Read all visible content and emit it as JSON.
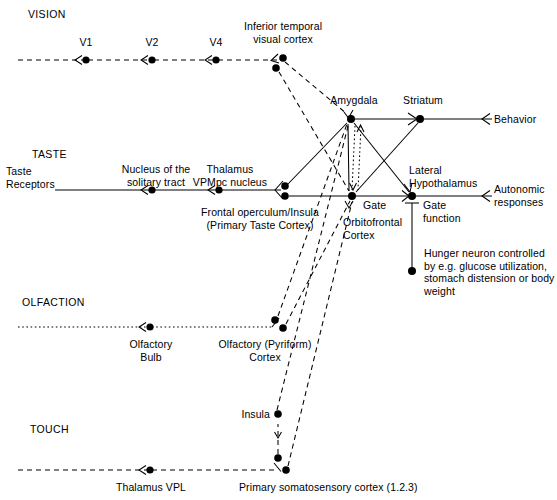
{
  "diagram": {
    "background_color": "#ffffff",
    "line_color": "#000000",
    "node_color": "#000000",
    "width": 557,
    "height": 500
  },
  "modalities": [
    {
      "name": "vision-heading",
      "label": "VISION"
    },
    {
      "name": "taste-heading",
      "label": "TASTE"
    },
    {
      "name": "olfaction-heading",
      "label": "OLFACTION"
    },
    {
      "name": "touch-heading",
      "label": "TOUCH"
    }
  ],
  "labels": {
    "vision": "VISION",
    "taste": "TASTE",
    "olfaction": "OLFACTION",
    "touch": "TOUCH",
    "v1": "V1",
    "v2": "V2",
    "v4": "V4",
    "inferior_temporal": "Inferior temporal\nvisual cortex",
    "taste_receptors": "Taste\nReceptors",
    "nucleus_solitary_tract": "Nucleus of the\nsolitary tract",
    "thalamus_vpmpc": "Thalamus\nVPMpc nucleus",
    "frontal_operculum": "Frontal operculum/Insula\n(Primary Taste Cortex)",
    "olfactory_bulb": "Olfactory\nBulb",
    "olfactory_pyriform": "Olfactory (Pyriform)\nCortex",
    "insula": "Insula",
    "thalamus_vpl": "Thalamus VPL",
    "primary_somatosensory": "Primary somatosensory cortex (1.2.3)",
    "amygdala": "Amygdala",
    "striatum": "Striatum",
    "behavior": "Behavior",
    "lateral_hypothalamus": "Lateral\nHypothalamus",
    "gate": "Gate",
    "gate_function": "Gate\nfunction",
    "orbitofrontal_cortex": "Orbitofrontal\nCortex",
    "autonomic_responses": "Autonomic\nresponses",
    "hunger_neuron": "Hunger neuron controlled\nby e.g. glucose utilization,\nstomach distension or body\nweight"
  },
  "nodes": [
    {
      "name": "node-v1",
      "label": "V1",
      "x": 86,
      "y": 60
    },
    {
      "name": "node-v2",
      "label": "V2",
      "x": 152,
      "y": 60
    },
    {
      "name": "node-v4",
      "label": "V4",
      "x": 216,
      "y": 60
    },
    {
      "name": "node-inferior-temporal-a",
      "label": "Inferior temporal visual cortex",
      "x": 283,
      "y": 58
    },
    {
      "name": "node-inferior-temporal-b",
      "label": "Inferior temporal visual cortex",
      "x": 276,
      "y": 68
    },
    {
      "name": "node-nucleus-solitary-tract",
      "label": "Nucleus of the solitary tract",
      "x": 152,
      "y": 190
    },
    {
      "name": "node-thalamus-vpmpc",
      "label": "Thalamus VPMpc nucleus",
      "x": 219,
      "y": 190
    },
    {
      "name": "node-frontal-operculum-a",
      "label": "Frontal operculum/Insula",
      "x": 285,
      "y": 186
    },
    {
      "name": "node-frontal-operculum-b",
      "label": "Frontal operculum/Insula",
      "x": 285,
      "y": 196
    },
    {
      "name": "node-olfactory-bulb",
      "label": "Olfactory Bulb",
      "x": 150,
      "y": 327
    },
    {
      "name": "node-olfactory-cortex-a",
      "label": "Olfactory (Pyriform) Cortex",
      "x": 275,
      "y": 320
    },
    {
      "name": "node-olfactory-cortex-b",
      "label": "Olfactory (Pyriform) Cortex",
      "x": 283,
      "y": 328
    },
    {
      "name": "node-insula",
      "label": "Insula",
      "x": 278,
      "y": 414
    },
    {
      "name": "node-thalamus-vpl",
      "label": "Thalamus VPL",
      "x": 150,
      "y": 470
    },
    {
      "name": "node-somatosensory-a",
      "label": "Primary somatosensory cortex (1.2.3)",
      "x": 278,
      "y": 458
    },
    {
      "name": "node-somatosensory-b",
      "label": "Primary somatosensory cortex (1.2.3)",
      "x": 286,
      "y": 470
    },
    {
      "name": "node-amygdala",
      "label": "Amygdala",
      "x": 351,
      "y": 119
    },
    {
      "name": "node-striatum",
      "label": "Striatum",
      "x": 420,
      "y": 119
    },
    {
      "name": "node-orbitofrontal-cortex",
      "label": "Orbitofrontal Cortex",
      "x": 352,
      "y": 196
    },
    {
      "name": "node-lateral-hypothalamus",
      "label": "Lateral Hypothalamus",
      "x": 412,
      "y": 196
    },
    {
      "name": "node-hunger-neuron",
      "label": "Hunger neuron",
      "x": 412,
      "y": 271
    }
  ],
  "outputs": [
    {
      "name": "output-behavior",
      "label": "Behavior"
    },
    {
      "name": "output-autonomic-responses",
      "label": "Autonomic responses"
    }
  ],
  "line_styles": {
    "solid": "solid",
    "dashed": "dashed",
    "dotted": "dotted"
  }
}
